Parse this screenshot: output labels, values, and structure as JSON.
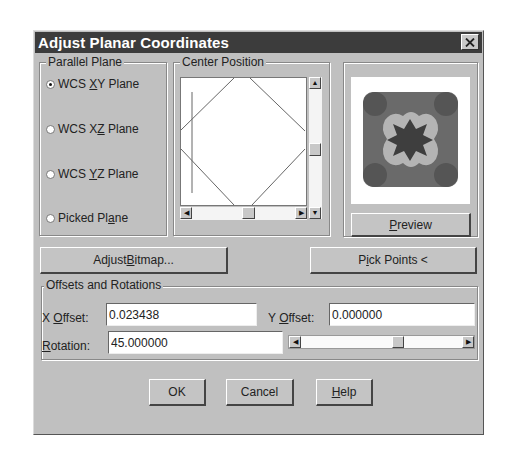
{
  "window": {
    "title": "Adjust Planar Coordinates",
    "close_icon": "close-icon"
  },
  "parallel_plane": {
    "label": "Parallel Plane",
    "options": [
      {
        "pre": "WCS ",
        "ul": "X",
        "post": "Y Plane",
        "selected": true
      },
      {
        "pre": "WCS X",
        "ul": "Z",
        "post": " Plane",
        "selected": false
      },
      {
        "pre": "WCS ",
        "ul": "Y",
        "post": "Z Plane",
        "selected": false
      },
      {
        "pre": "Picked Pl",
        "ul": "a",
        "post": "ne",
        "selected": false
      }
    ]
  },
  "center_position": {
    "label": "Center Position",
    "scroll_up_icon": "arrow-up-icon",
    "scroll_down_icon": "arrow-down-icon",
    "scroll_left_icon": "arrow-left-icon",
    "scroll_right_icon": "arrow-right-icon"
  },
  "preview": {
    "image": "tile-pattern-thumbnail",
    "button": {
      "ul": "P",
      "post": "review"
    }
  },
  "buttons": {
    "adjust_bitmap": {
      "pre": "Adjust ",
      "ul": "B",
      "post": "itmap..."
    },
    "pick_points": {
      "pre": "P",
      "ul": "i",
      "post": "ck Points <"
    },
    "ok": "OK",
    "cancel": "Cancel",
    "help": {
      "ul": "H",
      "post": "elp"
    }
  },
  "offsets": {
    "label": "Offsets and Rotations",
    "x_offset": {
      "pre": "X ",
      "ul": "O",
      "post": "ffset:",
      "value": "0.023438"
    },
    "y_offset": {
      "pre": "Y ",
      "ul": "O",
      "post": "ffset:",
      "value": "0.000000"
    },
    "rotation": {
      "pre": "",
      "ul": "R",
      "post": "otation:",
      "value": "45.000000"
    }
  }
}
